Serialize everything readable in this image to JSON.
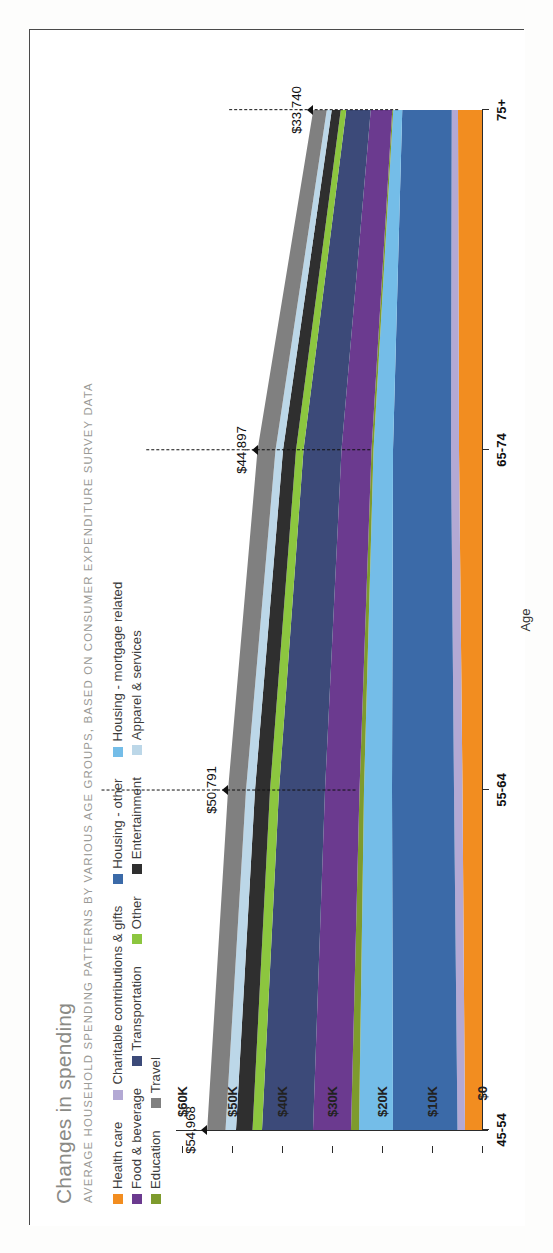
{
  "header": {
    "title": "Changes in spending",
    "subtitle": "AVERAGE HOUSEHOLD SPENDING PATTERNS BY VARIOUS AGE GROUPS, BASED ON CONSUMER EXPENDITURE SURVEY DATA"
  },
  "legend": {
    "rows": [
      [
        {
          "label": "Health care",
          "color": "#f28d20"
        },
        {
          "label": "Charitable contributions & gifts",
          "color": "#b3a9d4"
        },
        {
          "label": "Housing - other",
          "color": "#3b6aa8"
        },
        {
          "label": "Housing - mortgage related",
          "color": "#74bde8"
        }
      ],
      [
        {
          "label": "Food & beverage",
          "color": "#6b3a8f"
        },
        {
          "label": "Transportation",
          "color": "#3c4a79"
        },
        {
          "label": "Other",
          "color": "#8cc63f"
        },
        {
          "label": "Entertainment",
          "color": "#2f2f2f"
        },
        {
          "label": "Apparel & services",
          "color": "#bcd7e8"
        }
      ],
      [
        {
          "label": "Education",
          "color": "#7e9b2d"
        },
        {
          "label": "Travel",
          "color": "#808080"
        }
      ]
    ]
  },
  "chart_data": {
    "type": "area",
    "title": "Changes in spending",
    "subtitle": "AVERAGE HOUSEHOLD SPENDING PATTERNS BY VARIOUS AGE GROUPS, BASED ON CONSUMER EXPENDITURE SURVEY DATA",
    "xlabel": "Age",
    "ylabel": "",
    "categories": [
      "45-54",
      "55-64",
      "65-74",
      "75+"
    ],
    "ylim": [
      0,
      60000
    ],
    "yticks": [
      0,
      10000,
      20000,
      30000,
      40000,
      50000,
      60000
    ],
    "ytick_labels": [
      "$0",
      "$10K",
      "$20K",
      "$30K",
      "$40K",
      "$50K",
      "$60K"
    ],
    "grid": false,
    "legend_position": "top",
    "totals": [
      54968,
      50791,
      44897,
      33740
    ],
    "total_labels": [
      "$54,968",
      "$50,791",
      "$44,897",
      "$33,740"
    ],
    "stack_order_from_baseline": [
      "Health care",
      "Charitable contributions & gifts",
      "Housing - other",
      "Housing - mortgage related",
      "Education",
      "Food & beverage",
      "Transportation",
      "Other",
      "Entertainment",
      "Apparel & services",
      "Travel"
    ],
    "series": [
      {
        "name": "Health care",
        "color": "#f28d20",
        "values": [
          3400,
          3900,
          4600,
          4800
        ]
      },
      {
        "name": "Charitable contributions & gifts",
        "color": "#b3a9d4",
        "values": [
          1500,
          1700,
          1600,
          1250
        ]
      },
      {
        "name": "Housing - other",
        "color": "#3b6aa8",
        "values": [
          12900,
          12400,
          11600,
          9900
        ]
      },
      {
        "name": "Housing - mortgage related",
        "color": "#74bde8",
        "values": [
          6800,
          5600,
          3900,
          1800
        ]
      },
      {
        "name": "Education",
        "color": "#7e9b2d",
        "values": [
          1600,
          900,
          400,
          200
        ]
      },
      {
        "name": "Food & beverage",
        "color": "#6b3a8f",
        "values": [
          7600,
          6900,
          6000,
          4300
        ]
      },
      {
        "name": "Transportation",
        "color": "#3c4a79",
        "values": [
          10200,
          9200,
          7600,
          4900
        ]
      },
      {
        "name": "Other",
        "color": "#8cc63f",
        "values": [
          1900,
          1800,
          1500,
          1100
        ]
      },
      {
        "name": "Entertainment",
        "color": "#2f2f2f",
        "values": [
          3300,
          3000,
          2600,
          1800
        ]
      },
      {
        "name": "Apparel & services",
        "color": "#bcd7e8",
        "values": [
          2100,
          1800,
          1500,
          1000
        ]
      },
      {
        "name": "Travel",
        "color": "#808080",
        "values": [
          3668,
          3591,
          3597,
          2690
        ]
      }
    ],
    "annotations": [
      {
        "text": "$54,968",
        "category": "45-54"
      },
      {
        "text": "$50,791",
        "category": "55-64"
      },
      {
        "text": "$44,897",
        "category": "65-74"
      },
      {
        "text": "$33,740",
        "category": "75+"
      }
    ]
  }
}
